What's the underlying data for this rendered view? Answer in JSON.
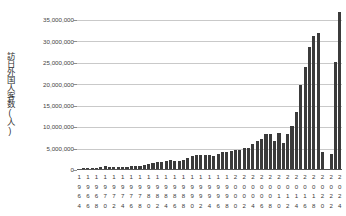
{
  "chart_data": {
    "type": "bar",
    "title": "",
    "subtitle": "",
    "xlabel": "",
    "ylabel": "訪日外国人客数(人)",
    "ylim": [
      0,
      37500000
    ],
    "grid": true,
    "legend": "none",
    "y_ticks": [
      {
        "value": 35000000,
        "label": "35,000,000"
      },
      {
        "value": 30000000,
        "label": "30,000,000"
      },
      {
        "value": 25000000,
        "label": "25,000,000"
      },
      {
        "value": 20000000,
        "label": "20,000,000"
      },
      {
        "value": 15000000,
        "label": "15,000,000"
      },
      {
        "value": 10000000,
        "label": "10,000,000"
      },
      {
        "value": 5000000,
        "label": "5,000,000"
      },
      {
        "value": 0,
        "label": "0"
      }
    ],
    "x_tick_step": 2,
    "x_tick_labels": [
      "1964",
      "1966",
      "1968",
      "1970",
      "1972",
      "1974",
      "1976",
      "1978",
      "1980",
      "1982",
      "1984",
      "1986",
      "1988",
      "1990",
      "1992",
      "1994",
      "1996",
      "1998",
      "2000",
      "2002",
      "2004",
      "2006",
      "2008",
      "2010",
      "2012",
      "2014",
      "2016",
      "2018",
      "2020",
      "2022",
      "2024"
    ],
    "categories": [
      "1964",
      "1965",
      "1966",
      "1967",
      "1968",
      "1969",
      "1970",
      "1971",
      "1972",
      "1973",
      "1974",
      "1975",
      "1976",
      "1977",
      "1978",
      "1979",
      "1980",
      "1981",
      "1982",
      "1983",
      "1984",
      "1985",
      "1986",
      "1987",
      "1988",
      "1989",
      "1990",
      "1991",
      "1992",
      "1993",
      "1994",
      "1995",
      "1996",
      "1997",
      "1998",
      "1999",
      "2000",
      "2001",
      "2002",
      "2003",
      "2004",
      "2005",
      "2006",
      "2007",
      "2008",
      "2009",
      "2010",
      "2011",
      "2012",
      "2013",
      "2014",
      "2015",
      "2016",
      "2017",
      "2018",
      "2019",
      "2020",
      "2021",
      "2022",
      "2023",
      "2024"
    ],
    "values": [
      352000,
      367000,
      433000,
      477000,
      519000,
      608000,
      854000,
      661000,
      724000,
      785000,
      764000,
      812000,
      915000,
      1026000,
      1039000,
      1113000,
      1317000,
      1583000,
      1793000,
      1968000,
      2110000,
      2327000,
      2062000,
      2155000,
      2355000,
      2835000,
      3236000,
      3533000,
      3582000,
      3410000,
      3468000,
      3345000,
      3837000,
      4218000,
      4106000,
      4438000,
      4757000,
      4772000,
      5239000,
      5212000,
      6138000,
      6728000,
      7334000,
      8347000,
      8351000,
      6790000,
      8611000,
      6219000,
      8358000,
      10364000,
      13413000,
      19737000,
      24040000,
      28691000,
      31192000,
      31882000,
      4116000,
      246000,
      3832000,
      25066000,
      36870000
    ],
    "bar_color": "#3b3b3b",
    "grid_color": "#c9c9c9",
    "axis_color": "#555555",
    "background": "#ffffff"
  }
}
